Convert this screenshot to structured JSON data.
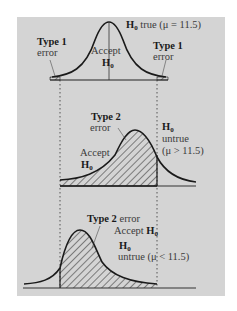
{
  "panels": {
    "top": {
      "title_h": "H",
      "title_sub": "0",
      "title_rest": " true (μ = 11.5)",
      "type1_left_bold": "Type 1",
      "type1_left_text": "error",
      "accept_text": "Accept",
      "accept_h": "H",
      "accept_sub": "0",
      "type1_right_bold": "Type 1",
      "type1_right_text": "error"
    },
    "middle": {
      "type2_bold": "Type 2",
      "type2_text": "error",
      "accept_text": "Accept",
      "accept_h": "H",
      "accept_sub": "0",
      "h0_h": "H",
      "h0_sub": "0",
      "untrue": "untrue",
      "condition": "(μ > 11.5)"
    },
    "bottom": {
      "type2_bold": "Type 2",
      "type2_text": " error",
      "accept_text": "Accept ",
      "accept_h": "H",
      "accept_sub": "0",
      "h0_h": "H",
      "h0_sub": "0",
      "untrue": "untrue",
      "condition": "(μ < 11.5)"
    }
  },
  "colors": {
    "background": "#d4d4d4",
    "curve": "#1a1a1a"
  }
}
